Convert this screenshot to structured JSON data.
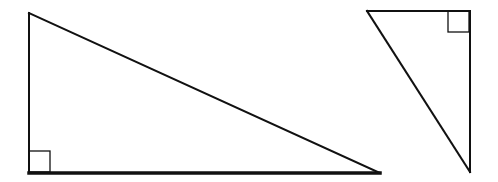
{
  "diagram": {
    "stroke_color": "#111111",
    "background": "#ffffff",
    "shapes": [
      {
        "id": "triangle-left",
        "type": "right-triangle",
        "vertices": [
          [
            29,
            13
          ],
          [
            29,
            173
          ],
          [
            380,
            173
          ]
        ],
        "right_angle_vertex": [
          29,
          173
        ],
        "right_angle_marker": {
          "x": 29,
          "y": 151,
          "size": 21
        },
        "stroke_width": 2,
        "base_stroke_width": 3.5
      },
      {
        "id": "triangle-right",
        "type": "right-triangle",
        "vertices": [
          [
            367,
            11
          ],
          [
            470,
            11
          ],
          [
            470,
            172
          ]
        ],
        "right_angle_vertex": [
          470,
          11
        ],
        "right_angle_marker": {
          "x": 448,
          "y": 11,
          "size": 21
        },
        "stroke_width": 2
      }
    ]
  }
}
